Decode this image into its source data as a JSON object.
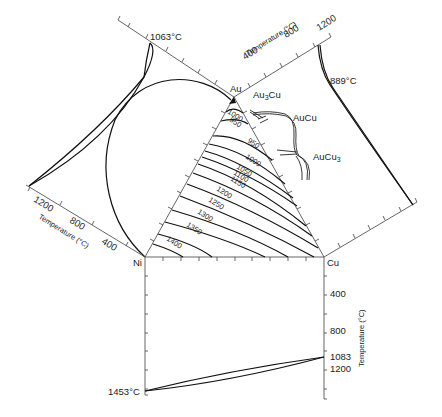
{
  "figure": {
    "type": "ternary phase diagram with binary edge diagrams",
    "system": "Au-Cu-Ni",
    "corners": {
      "top": "Au",
      "left": "Ni",
      "right": "Cu"
    },
    "intermetallics": [
      "Au3Cu",
      "AuCu",
      "AuCu3"
    ],
    "melting_points": {
      "Au": "1063°C",
      "Ni": "1453°C",
      "Cu": "1083°C"
    },
    "au_cu_minimum": "889°C"
  },
  "labels": {
    "au": "Au",
    "ni": "Ni",
    "cu": "Cu",
    "au3cu": "Au",
    "au3cu_sub": "3",
    "au3cu_tail": "Cu",
    "aucu": "AuCu",
    "aucu3": "AuCu",
    "aucu3_sub": "3",
    "mp_au": "1063°C",
    "mp_ni": "1453°C",
    "mp_cu": "1083",
    "min_aucu": "889°C"
  },
  "axes": {
    "au_cu": {
      "title": "Temperature (°C)",
      "ticks": [
        "400",
        "800",
        "1200"
      ]
    },
    "au_ni": {
      "title": "Temperature (°C)",
      "ticks": [
        "1200",
        "800",
        "400"
      ]
    },
    "ni_cu": {
      "title": "Temperature (°C)",
      "ticks": [
        "400",
        "800",
        "1083",
        "1200"
      ]
    }
  },
  "isotherms": {
    "labels": [
      "1000",
      "950",
      "950",
      "1000",
      "1050",
      "1100",
      "1150",
      "1200",
      "1250",
      "1300",
      "1350",
      "1400"
    ]
  }
}
